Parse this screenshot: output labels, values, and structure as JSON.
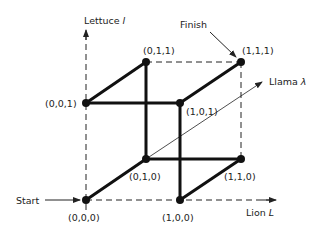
{
  "diagram": {
    "axes": {
      "y_label": "Lettuce",
      "y_symbol": "l",
      "x_label": "Lion",
      "x_symbol": "L",
      "z_label": "Llama",
      "z_symbol": "λ"
    },
    "annotations": {
      "start": "Start",
      "finish": "Finish"
    },
    "nodes": [
      {
        "id": "000",
        "label": "(0,0,0)"
      },
      {
        "id": "100",
        "label": "(1,0,0)"
      },
      {
        "id": "010",
        "label": "(0,1,0)"
      },
      {
        "id": "110",
        "label": "(1,1,0)"
      },
      {
        "id": "001",
        "label": "(0,0,1)"
      },
      {
        "id": "101",
        "label": "(1,0,1)"
      },
      {
        "id": "011",
        "label": "(0,1,1)"
      },
      {
        "id": "111",
        "label": "(1,1,1)"
      }
    ],
    "path_edges": [
      [
        "000",
        "010"
      ],
      [
        "010",
        "011"
      ],
      [
        "011",
        "001"
      ],
      [
        "001",
        "101"
      ],
      [
        "101",
        "100"
      ],
      [
        "100",
        "110"
      ],
      [
        "110",
        "010"
      ],
      [
        "101",
        "111"
      ]
    ],
    "dashed_edges": [
      [
        "000",
        "100"
      ],
      [
        "000",
        "001"
      ],
      [
        "011",
        "111"
      ],
      [
        "111",
        "110"
      ]
    ]
  }
}
